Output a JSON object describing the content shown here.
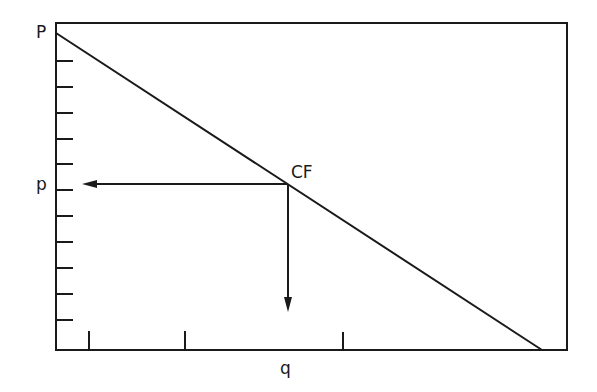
{
  "diagram": {
    "type": "demand-curve",
    "labels": {
      "y_intercept": "P",
      "price_level": "p",
      "point": "CF",
      "x_axis": "q"
    },
    "colors": {
      "ink": "#1a1a1a",
      "background": "#ffffff"
    },
    "y_axis_tick_count": 11,
    "x_axis_tick_count": 3
  }
}
